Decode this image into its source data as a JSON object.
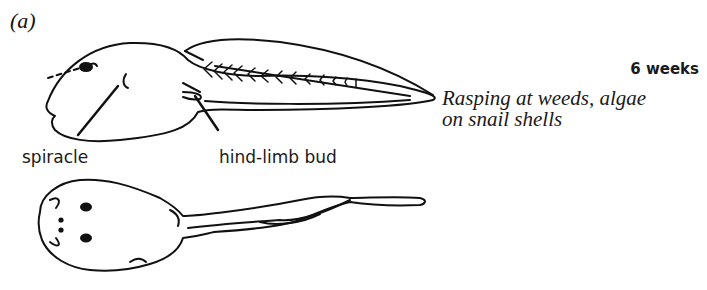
{
  "figure": {
    "panel_label": "(a)",
    "age": "6 weeks",
    "description_lines": [
      "Rasping at weeds, algae",
      "on snail shells"
    ],
    "annotations": {
      "spiracle": "spiracle",
      "hind_limb_bud": "hind-limb bud"
    },
    "views": [
      "side-view tadpole",
      "dorsal-view tadpole"
    ]
  }
}
